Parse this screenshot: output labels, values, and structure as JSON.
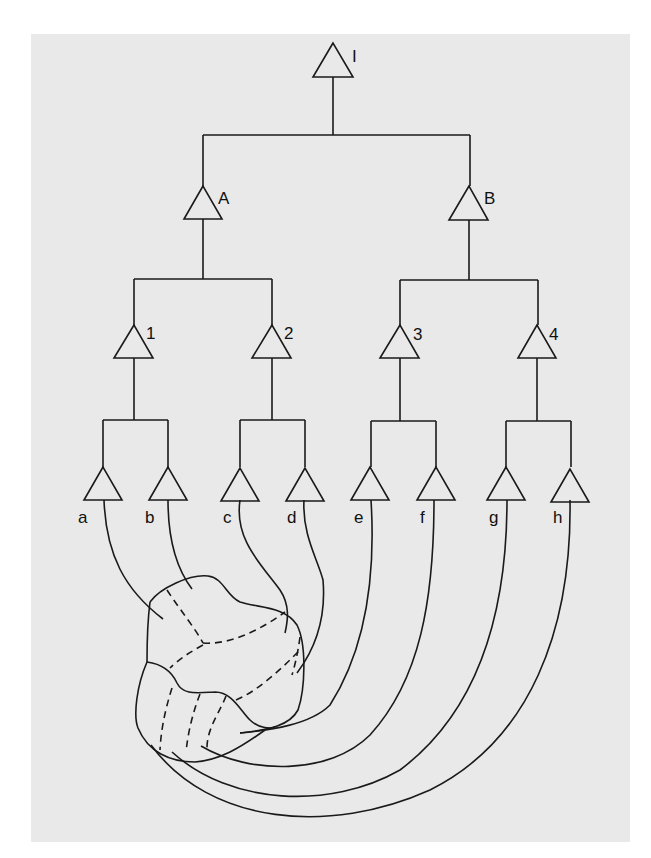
{
  "diagram": {
    "type": "hierarchical-tree-with-receptive-mapping",
    "colors": {
      "background": "#e9e9e9",
      "stroke": "#1a1a1a"
    },
    "root": {
      "label": "I"
    },
    "level1": [
      {
        "label": "A"
      },
      {
        "label": "B"
      }
    ],
    "level2": [
      {
        "label": "1"
      },
      {
        "label": "2"
      },
      {
        "label": "3"
      },
      {
        "label": "4"
      }
    ],
    "leaves": [
      {
        "label": "a"
      },
      {
        "label": "b"
      },
      {
        "label": "c"
      },
      {
        "label": "d"
      },
      {
        "label": "e"
      },
      {
        "label": "f"
      },
      {
        "label": "g"
      },
      {
        "label": "h"
      }
    ]
  }
}
